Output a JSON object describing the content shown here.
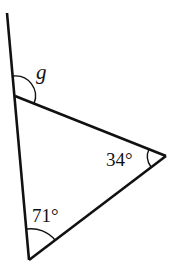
{
  "diagram": {
    "type": "triangle-exterior-angle",
    "labels": {
      "exterior_angle": "g",
      "right_angle": "34°",
      "bottom_angle": "71°"
    },
    "vertices": {
      "top": [
        15,
        96
      ],
      "right": [
        166,
        156
      ],
      "bottom": [
        29,
        260
      ]
    },
    "extension_line_end": [
      7,
      13
    ],
    "stroke_color": "#111111"
  }
}
